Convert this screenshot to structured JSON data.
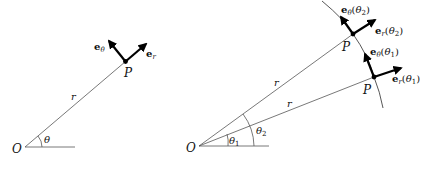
{
  "figure_left": {
    "origin_label": "O",
    "point_label": "P",
    "radius_label": "r",
    "angle_label": "θ",
    "basis_radial": {
      "symbol": "e",
      "sub": "r"
    },
    "basis_angular": {
      "symbol": "e",
      "sub": "θ"
    }
  },
  "figure_right": {
    "origin_label": "O",
    "point1_label": "P",
    "point2_label": "P",
    "radius1_label": "r",
    "radius2_label": "r",
    "angle1_label": "θ",
    "angle1_sub": "1",
    "angle2_label": "θ",
    "angle2_sub": "2",
    "er_theta1": {
      "symbol": "e",
      "sub": "r",
      "arg_open": "(",
      "arg": "θ",
      "arg_sub": "1",
      "arg_close": ")"
    },
    "etheta_theta1": {
      "symbol": "e",
      "sub": "θ",
      "arg_open": "(",
      "arg": "θ",
      "arg_sub": "1",
      "arg_close": ")"
    },
    "er_theta2": {
      "symbol": "e",
      "sub": "r",
      "arg_open": "(",
      "arg": "θ",
      "arg_sub": "2",
      "arg_close": ")"
    },
    "etheta_theta2": {
      "symbol": "e",
      "sub": "θ",
      "arg_open": "(",
      "arg": "θ",
      "arg_sub": "2",
      "arg_close": ")"
    }
  },
  "colors": {
    "line": "#555555",
    "vector": "#000000",
    "background": "#ffffff"
  }
}
